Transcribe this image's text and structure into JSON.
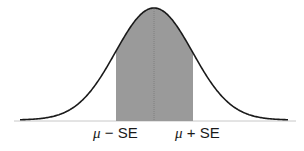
{
  "chart_data": {
    "type": "area",
    "title": "",
    "distribution": "normal",
    "shaded_range": [
      "μ − SE",
      "μ + SE"
    ],
    "center_line": "μ",
    "tick_labels": [
      {
        "symbol": "μ",
        "op": "−",
        "term": "SE"
      },
      {
        "symbol": "μ",
        "op": "+",
        "term": "SE"
      }
    ],
    "xlabel": "",
    "ylabel": "",
    "grid": false,
    "legend": null
  },
  "colors": {
    "curve": "#1a1a1a",
    "shade": "#9a9a9a",
    "baseline": "#c8c8c8",
    "center_line": "#7a7a7a"
  },
  "labels": {
    "left": {
      "symbol": "μ",
      "rest": " − SE"
    },
    "right": {
      "symbol": "μ",
      "rest": " + SE"
    }
  }
}
